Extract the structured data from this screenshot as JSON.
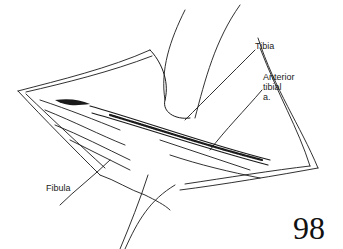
{
  "figure": {
    "type": "surgical-illustration",
    "labels": {
      "tibia": "Tibia",
      "anterior_tibial_line1": "Anterior",
      "anterior_tibial_line2": "tibial",
      "anterior_tibial_line3": "a.",
      "fibula": "Fibula"
    },
    "page_number": "98"
  }
}
